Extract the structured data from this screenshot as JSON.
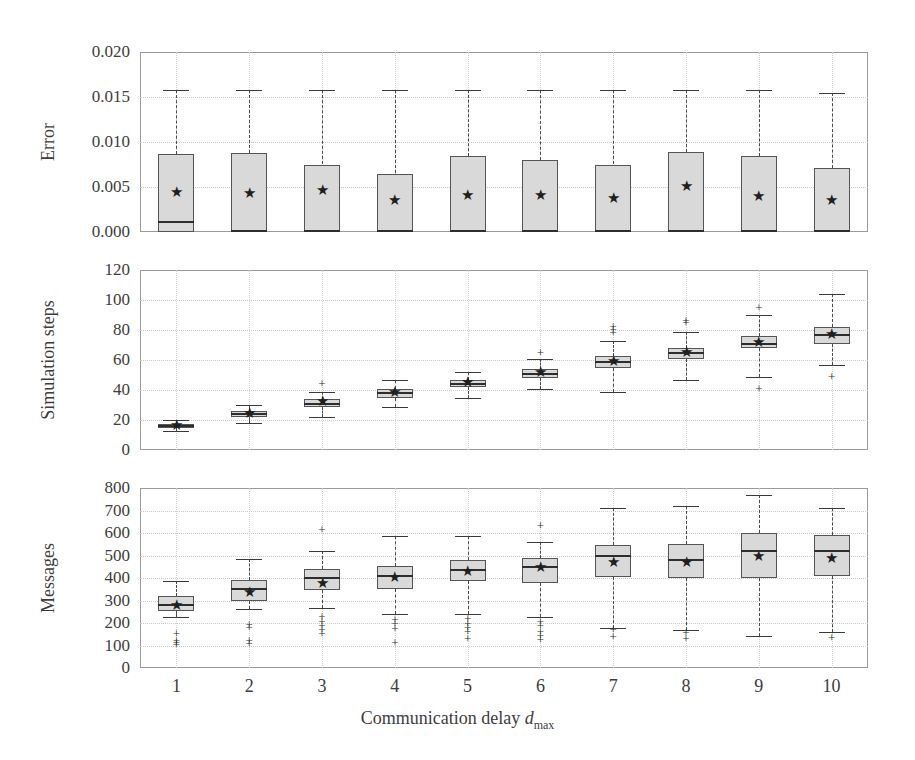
{
  "figure": {
    "xaxis_title_main": "Communication delay ",
    "xaxis_title_var": "d",
    "xaxis_title_sub": "max",
    "xtick_labels": [
      "1",
      "2",
      "3",
      "4",
      "5",
      "6",
      "7",
      "8",
      "9",
      "10"
    ]
  },
  "chart_data": {
    "type": "box",
    "title": "",
    "xlabel": "Communication delay d_max",
    "grid": true,
    "legend": false,
    "categories": [
      1,
      2,
      3,
      4,
      5,
      6,
      7,
      8,
      9,
      10
    ],
    "panels": [
      {
        "ylabel": "Error",
        "ylim": [
          0.0,
          0.02
        ],
        "yticks": [
          0.0,
          0.005,
          0.01,
          0.015,
          0.02
        ],
        "ytick_labels": [
          "0.000",
          "0.005",
          "0.010",
          "0.015",
          "0.020"
        ],
        "boxes": [
          {
            "x": 1,
            "whislo": 0.0,
            "q1": 0.0,
            "med": 0.0011,
            "q3": 0.0087,
            "whishi": 0.0158,
            "mean": 0.0043,
            "outliers": []
          },
          {
            "x": 2,
            "whislo": 0.0,
            "q1": 0.0,
            "med": 0.0001,
            "q3": 0.0088,
            "whishi": 0.0158,
            "mean": 0.0042,
            "outliers": []
          },
          {
            "x": 3,
            "whislo": 0.0,
            "q1": 0.0,
            "med": 0.0001,
            "q3": 0.0075,
            "whishi": 0.0158,
            "mean": 0.0046,
            "outliers": []
          },
          {
            "x": 4,
            "whislo": 0.0,
            "q1": 0.0,
            "med": 0.0001,
            "q3": 0.0065,
            "whishi": 0.0158,
            "mean": 0.0034,
            "outliers": []
          },
          {
            "x": 5,
            "whislo": 0.0,
            "q1": 0.0,
            "med": 0.0001,
            "q3": 0.0084,
            "whishi": 0.0158,
            "mean": 0.004,
            "outliers": []
          },
          {
            "x": 6,
            "whislo": 0.0,
            "q1": 0.0,
            "med": 0.0001,
            "q3": 0.008,
            "whishi": 0.0158,
            "mean": 0.004,
            "outliers": []
          },
          {
            "x": 7,
            "whislo": 0.0,
            "q1": 0.0,
            "med": 0.0001,
            "q3": 0.0075,
            "whishi": 0.0158,
            "mean": 0.0037,
            "outliers": []
          },
          {
            "x": 8,
            "whislo": 0.0,
            "q1": 0.0,
            "med": 0.0001,
            "q3": 0.0089,
            "whishi": 0.0158,
            "mean": 0.005,
            "outliers": []
          },
          {
            "x": 9,
            "whislo": 0.0,
            "q1": 0.0,
            "med": 0.0001,
            "q3": 0.0084,
            "whishi": 0.0158,
            "mean": 0.0039,
            "outliers": []
          },
          {
            "x": 10,
            "whislo": 0.0,
            "q1": 0.0,
            "med": 0.0001,
            "q3": 0.0071,
            "whishi": 0.0155,
            "mean": 0.0035,
            "outliers": []
          }
        ]
      },
      {
        "ylabel": "Simulation steps",
        "ylim": [
          0,
          120
        ],
        "yticks": [
          0,
          20,
          40,
          60,
          80,
          100,
          120
        ],
        "ytick_labels": [
          "0",
          "20",
          "40",
          "60",
          "80",
          "100",
          "120"
        ],
        "boxes": [
          {
            "x": 1,
            "whislo": 13,
            "q1": 14.5,
            "med": 16,
            "q3": 17.5,
            "whishi": 20,
            "mean": 16,
            "outliers": []
          },
          {
            "x": 2,
            "whislo": 18,
            "q1": 22,
            "med": 24,
            "q3": 26,
            "whishi": 30,
            "mean": 24,
            "outliers": []
          },
          {
            "x": 3,
            "whislo": 22,
            "q1": 29,
            "med": 31,
            "q3": 34,
            "whishi": 39,
            "mean": 32,
            "outliers": [
              44
            ]
          },
          {
            "x": 4,
            "whislo": 29,
            "q1": 35,
            "med": 38,
            "q3": 41,
            "whishi": 47,
            "mean": 38,
            "outliers": []
          },
          {
            "x": 5,
            "whislo": 35,
            "q1": 42,
            "med": 44,
            "q3": 47,
            "whishi": 52,
            "mean": 44.5,
            "outliers": []
          },
          {
            "x": 6,
            "whislo": 41,
            "q1": 48,
            "med": 51,
            "q3": 54,
            "whishi": 61,
            "mean": 51.5,
            "outliers": [
              65
            ]
          },
          {
            "x": 7,
            "whislo": 39,
            "q1": 55,
            "med": 59,
            "q3": 63,
            "whishi": 73,
            "mean": 59,
            "outliers": [
              78,
              80,
              82
            ]
          },
          {
            "x": 8,
            "whislo": 47,
            "q1": 61,
            "med": 65,
            "q3": 68,
            "whishi": 79,
            "mean": 64.5,
            "outliers": [
              85,
              86
            ]
          },
          {
            "x": 9,
            "whislo": 49,
            "q1": 68,
            "med": 71,
            "q3": 76,
            "whishi": 90,
            "mean": 71.5,
            "outliers": [
              41,
              95
            ]
          },
          {
            "x": 10,
            "whislo": 57,
            "q1": 71,
            "med": 77,
            "q3": 82,
            "whishi": 104,
            "mean": 76.5,
            "outliers": [
              49
            ]
          }
        ]
      },
      {
        "ylabel": "Messages",
        "ylim": [
          0,
          800
        ],
        "yticks": [
          0,
          100,
          200,
          300,
          400,
          500,
          600,
          700,
          800
        ],
        "ytick_labels": [
          "0",
          "100",
          "200",
          "300",
          "400",
          "500",
          "600",
          "700",
          "800"
        ],
        "boxes": [
          {
            "x": 1,
            "whislo": 225,
            "q1": 252,
            "med": 280,
            "q3": 318,
            "whishi": 387,
            "mean": 275,
            "outliers": [
              152,
              120,
              110,
              102
            ]
          },
          {
            "x": 2,
            "whislo": 262,
            "q1": 300,
            "med": 352,
            "q3": 390,
            "whishi": 485,
            "mean": 333,
            "outliers": [
              192,
              180,
              118,
              105
            ]
          },
          {
            "x": 3,
            "whislo": 265,
            "q1": 348,
            "med": 400,
            "q3": 440,
            "whishi": 522,
            "mean": 375,
            "outliers": [
              612,
              228,
              205,
              185,
              168,
              152
            ]
          },
          {
            "x": 4,
            "whislo": 242,
            "q1": 352,
            "med": 410,
            "q3": 452,
            "whishi": 588,
            "mean": 402,
            "outliers": [
              215,
              195,
              175,
              110
            ]
          },
          {
            "x": 5,
            "whislo": 240,
            "q1": 385,
            "med": 435,
            "q3": 478,
            "whishi": 588,
            "mean": 425,
            "outliers": [
              220,
              195,
              180,
              160,
              128
            ]
          },
          {
            "x": 6,
            "whislo": 228,
            "q1": 378,
            "med": 448,
            "q3": 488,
            "whishi": 560,
            "mean": 443,
            "outliers": [
              632,
              205,
              185,
              158,
              142,
              125
            ]
          },
          {
            "x": 7,
            "whislo": 180,
            "q1": 405,
            "med": 498,
            "q3": 545,
            "whishi": 712,
            "mean": 468,
            "outliers": [
              168,
              140
            ]
          },
          {
            "x": 8,
            "whislo": 168,
            "q1": 398,
            "med": 478,
            "q3": 552,
            "whishi": 722,
            "mean": 465,
            "outliers": [
              155,
              128
            ]
          },
          {
            "x": 9,
            "whislo": 142,
            "q1": 402,
            "med": 518,
            "q3": 598,
            "whishi": 768,
            "mean": 492,
            "outliers": []
          },
          {
            "x": 10,
            "whislo": 162,
            "q1": 408,
            "med": 518,
            "q3": 592,
            "whishi": 710,
            "mean": 485,
            "outliers": [
              135
            ]
          }
        ]
      }
    ]
  }
}
